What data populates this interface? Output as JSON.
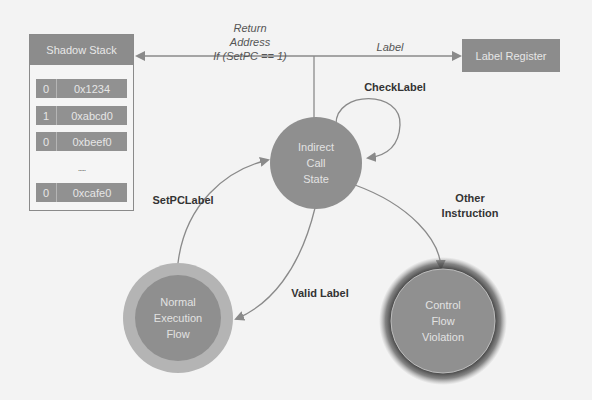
{
  "shadow_stack": {
    "title": "Shadow Stack",
    "rows": [
      {
        "bit": "0",
        "address": "0x1234"
      },
      {
        "bit": "1",
        "address": "0xabcd0"
      },
      {
        "bit": "0",
        "address": "0xbeef0"
      },
      {
        "bit": "0",
        "address": "0xcafe0"
      }
    ],
    "ellipsis": "....."
  },
  "label_register": {
    "title": "Label Register"
  },
  "edges": {
    "return_address": {
      "line1": "Return",
      "line2": "Address",
      "line3": "If (SetPC == 1)"
    },
    "label": "Label",
    "check_label": "CheckLabel",
    "set_pc_label": "SetPCLabel",
    "valid_label": "Valid Label",
    "other_instruction": {
      "line1": "Other",
      "line2": "Instruction"
    }
  },
  "nodes": {
    "indirect_call_state": {
      "line1": "Indirect",
      "line2": "Call",
      "line3": "State"
    },
    "normal_execution_flow": {
      "line1": "Normal",
      "line2": "Execution",
      "line3": "Flow"
    },
    "control_flow_violation": {
      "line1": "Control",
      "line2": "Flow",
      "line3": "Violation"
    }
  },
  "colors": {
    "background": "#f3f3f3",
    "node_fill": "#8f8f8f",
    "normal_ring": "#b4b4b4",
    "violation_glow": "#3a3a3a",
    "line": "#8a8a8a"
  }
}
